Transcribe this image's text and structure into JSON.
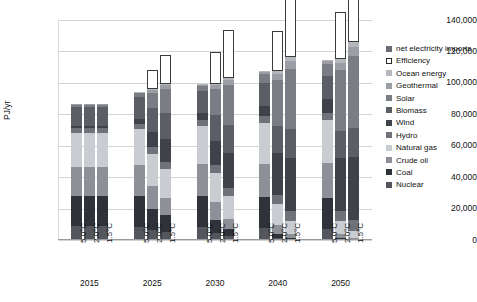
{
  "chart_data": {
    "type": "bar",
    "stacked": true,
    "title": "",
    "xlabel": "",
    "ylabel": "PJ/yr",
    "ylim": [
      0,
      140000
    ],
    "ytick_labels": [
      "140,000",
      "120,000",
      "100,000",
      "80,000",
      "60,000",
      "40,000",
      "20,000",
      "0"
    ],
    "ytick_values": [
      140000,
      120000,
      100000,
      80000,
      60000,
      40000,
      20000,
      0
    ],
    "grid": true,
    "legend_position": "right",
    "group_labels": [
      "2015",
      "2025",
      "2030",
      "2040",
      "2050"
    ],
    "scenario_labels": [
      "5.0°C",
      "2.0°C",
      "1.5°C"
    ],
    "categories": [
      "2015 5.0°C",
      "2015 2.0°C",
      "2015 1.5°C",
      "2025 5.0°C",
      "2025 2.0°C",
      "2025 1.5°C",
      "2030 5.0°C",
      "2030 2.0°C",
      "2030 1.5°C",
      "2040 5.0°C",
      "2040 2.0°C",
      "2040 1.5°C",
      "2050 5.0°C",
      "2050 2.0°C",
      "2050 1.5°C"
    ],
    "series": [
      {
        "name": "Nuclear",
        "color": "#53565c",
        "values": [
          9000,
          9000,
          9000,
          8500,
          6500,
          5200,
          8200,
          4200,
          2600,
          7600,
          1200,
          0,
          7000,
          0,
          0
        ]
      },
      {
        "name": "Coal",
        "color": "#2f3238",
        "values": [
          19000,
          19000,
          19000,
          19500,
          13500,
          10500,
          19500,
          8500,
          4200,
          19500,
          2600,
          1200,
          19500,
          1000,
          0
        ]
      },
      {
        "name": "Crude oil",
        "color": "#8d9096",
        "values": [
          18500,
          18500,
          18500,
          19500,
          14500,
          11000,
          20500,
          11500,
          6500,
          21500,
          5500,
          2600,
          22500,
          2600,
          1200
        ]
      },
      {
        "name": "Natural gas",
        "color": "#c9ccd1",
        "values": [
          21500,
          21500,
          21500,
          23000,
          20500,
          18500,
          24500,
          18500,
          14500,
          26000,
          13500,
          8500,
          27500,
          8500,
          4500
        ]
      },
      {
        "name": "Hydro",
        "color": "#6f7279",
        "values": [
          3200,
          3200,
          3200,
          3600,
          4200,
          4500,
          3800,
          4800,
          5200,
          4200,
          5800,
          6200,
          4500,
          6500,
          6800
        ]
      },
      {
        "name": "Wind",
        "color": "#3f4248",
        "values": [
          1200,
          1200,
          1200,
          3200,
          9500,
          14500,
          4200,
          15500,
          22500,
          6500,
          26500,
          33500,
          8500,
          33500,
          40500
        ]
      },
      {
        "name": "Biomass",
        "color": "#5b5e65",
        "values": [
          12500,
          12500,
          12500,
          13500,
          15500,
          16500,
          14000,
          16500,
          17500,
          14500,
          17500,
          18500,
          15000,
          17500,
          18500
        ]
      },
      {
        "name": "Solar",
        "color": "#7a7d84",
        "values": [
          800,
          800,
          800,
          2600,
          9500,
          15500,
          3600,
          16500,
          25500,
          5800,
          29500,
          38500,
          7800,
          38500,
          45500
        ]
      },
      {
        "name": "Geothermal",
        "color": "#9b9ea4",
        "values": [
          600,
          600,
          600,
          900,
          1800,
          2400,
          1100,
          2600,
          3400,
          1500,
          3800,
          4800,
          1800,
          4800,
          5800
        ]
      },
      {
        "name": "Ocean energy",
        "color": "#b4b7bc",
        "values": [
          0,
          0,
          0,
          100,
          400,
          700,
          200,
          700,
          1300,
          400,
          1600,
          2400,
          600,
          2400,
          3400
        ]
      },
      {
        "name": "Efficiency",
        "color": "#ffffff",
        "values": [
          0,
          0,
          0,
          0,
          12500,
          18500,
          0,
          20500,
          30500,
          0,
          25500,
          38500,
          0,
          29500,
          42500
        ]
      },
      {
        "name": "net electricity imports",
        "color": "#6a6d74",
        "values": [
          0,
          0,
          0,
          0,
          0,
          0,
          0,
          0,
          0,
          0,
          0,
          0,
          0,
          0,
          0
        ]
      }
    ],
    "totals": [
      112500,
      112500,
      112500,
      116500,
      116500,
      116500,
      112500,
      115500,
      115500,
      116500,
      116500,
      116500,
      121500,
      121500,
      121500
    ]
  },
  "legend": {
    "items": [
      {
        "label": "net electricity imports",
        "swatch": "solid",
        "color": "#6a6d74"
      },
      {
        "label": "Efficiency",
        "swatch": "hollow",
        "color": "#ffffff"
      },
      {
        "label": "Ocean energy",
        "swatch": "solid",
        "color": "#b4b7bc"
      },
      {
        "label": "Geothermal",
        "swatch": "solid",
        "color": "#9b9ea4"
      },
      {
        "label": "Solar",
        "swatch": "solid",
        "color": "#7a7d84"
      },
      {
        "label": "Biomass",
        "swatch": "solid",
        "color": "#5b5e65"
      },
      {
        "label": "Wind",
        "swatch": "solid",
        "color": "#3f4248"
      },
      {
        "label": "Hydro",
        "swatch": "solid",
        "color": "#6f7279"
      },
      {
        "label": "Natural gas",
        "swatch": "solid",
        "color": "#c9ccd1"
      },
      {
        "label": "Crude oil",
        "swatch": "solid",
        "color": "#8d9096"
      },
      {
        "label": "Coal",
        "swatch": "solid",
        "color": "#2f3238"
      },
      {
        "label": "Nuclear",
        "swatch": "solid",
        "color": "#53565c"
      }
    ]
  },
  "caption": {
    "text": ""
  }
}
